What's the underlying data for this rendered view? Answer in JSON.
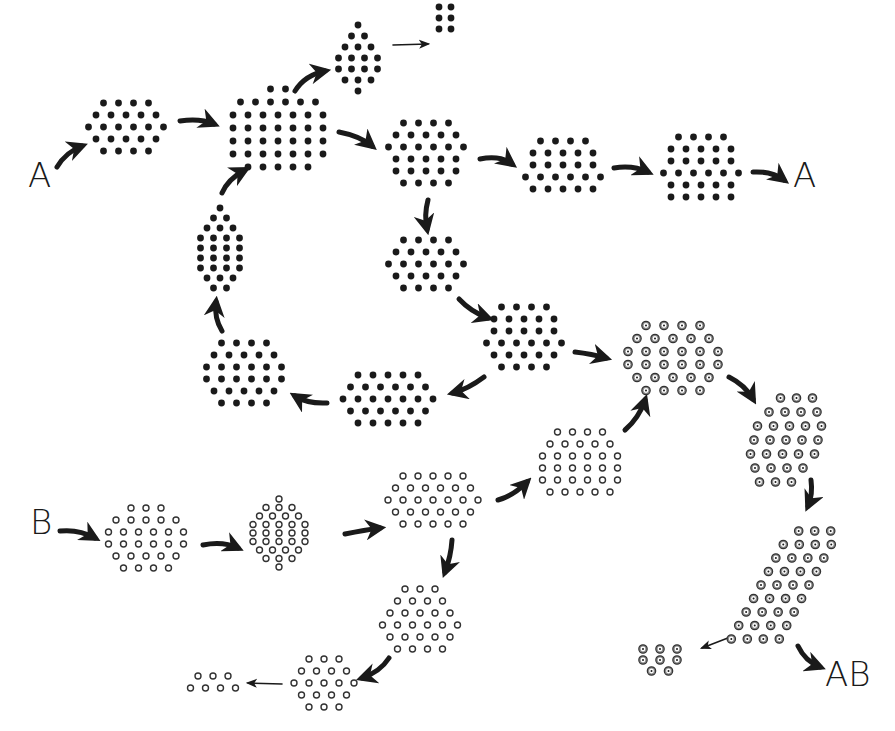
{
  "colors": {
    "background": "#ffffff",
    "solid_dot": "#1a1a1a",
    "ring_dot": "#333333",
    "target_dot_fill": "#8a8a8a",
    "arrow": "#1a1a1a"
  },
  "labels": [
    {
      "id": "A-start",
      "text": "A",
      "x": 28,
      "y": 158
    },
    {
      "id": "A-end",
      "text": "A",
      "x": 793,
      "y": 158
    },
    {
      "id": "B-start",
      "text": "B",
      "x": 30,
      "y": 505
    },
    {
      "id": "AB-end",
      "text": "AB",
      "x": 825,
      "y": 657
    }
  ],
  "clusters": [
    {
      "id": "a1",
      "type": "solid",
      "cx": 126,
      "cy": 127,
      "rows": [
        4,
        5,
        6,
        5,
        4
      ],
      "dx": 15,
      "dy": 12,
      "shear": 0
    },
    {
      "id": "a2",
      "type": "solid",
      "cx": 278,
      "cy": 128,
      "rows": [
        2,
        6,
        7,
        7,
        7,
        7,
        5
      ],
      "dx": 15,
      "dy": 13,
      "shear": 0
    },
    {
      "id": "a3",
      "type": "solid",
      "cx": 358,
      "cy": 58,
      "rows": [
        1,
        2,
        3,
        4,
        4,
        3,
        1
      ],
      "dx": 13,
      "dy": 11,
      "shear": 0
    },
    {
      "id": "a3b",
      "type": "solid",
      "cx": 445,
      "cy": 18,
      "rows": [
        2,
        2,
        2
      ],
      "dx": 12,
      "dy": 11,
      "shear": 0
    },
    {
      "id": "a4",
      "type": "solid",
      "cx": 426,
      "cy": 153,
      "rows": [
        4,
        5,
        6,
        5,
        5,
        4
      ],
      "dx": 15,
      "dy": 12,
      "shear": 0
    },
    {
      "id": "a5",
      "type": "solid",
      "cx": 563,
      "cy": 165,
      "rows": [
        4,
        5,
        5,
        6,
        5
      ],
      "dx": 15,
      "dy": 12,
      "shear": 0
    },
    {
      "id": "a6",
      "type": "solid",
      "cx": 701,
      "cy": 167,
      "rows": [
        4,
        5,
        5,
        6,
        5,
        5
      ],
      "dx": 15,
      "dy": 12,
      "shear": 0
    },
    {
      "id": "a7",
      "type": "solid",
      "cx": 426,
      "cy": 264,
      "rows": [
        4,
        5,
        6,
        5,
        4
      ],
      "dx": 15,
      "dy": 12,
      "shear": 0
    },
    {
      "id": "a8",
      "type": "solid",
      "cx": 524,
      "cy": 337,
      "rows": [
        4,
        5,
        5,
        6,
        5,
        4
      ],
      "dx": 15,
      "dy": 12,
      "shear": 0
    },
    {
      "id": "a9",
      "type": "solid",
      "cx": 388,
      "cy": 399,
      "rows": [
        5,
        6,
        7,
        6,
        5
      ],
      "dx": 15,
      "dy": 12,
      "shear": 0
    },
    {
      "id": "a10",
      "type": "solid",
      "cx": 244,
      "cy": 373,
      "rows": [
        4,
        5,
        6,
        6,
        5,
        4
      ],
      "dx": 15,
      "dy": 12,
      "shear": 0
    },
    {
      "id": "a11",
      "type": "solid",
      "cx": 220,
      "cy": 248,
      "rows": [
        1,
        2,
        3,
        4,
        4,
        4,
        4,
        3,
        2
      ],
      "dx": 13,
      "dy": 10,
      "shear": 0
    },
    {
      "id": "b1",
      "type": "ring",
      "cx": 146,
      "cy": 538,
      "rows": [
        3,
        5,
        6,
        6,
        5,
        4
      ],
      "dx": 15,
      "dy": 12,
      "shear": 0
    },
    {
      "id": "b2",
      "type": "ring",
      "cx": 279,
      "cy": 533,
      "rows": [
        1,
        3,
        4,
        5,
        5,
        5,
        4,
        3,
        1
      ],
      "dx": 13,
      "dy": 8.5,
      "shear": 0
    },
    {
      "id": "b3",
      "type": "ring",
      "cx": 433,
      "cy": 500,
      "rows": [
        5,
        6,
        7,
        6,
        5
      ],
      "dx": 15,
      "dy": 12,
      "shear": 0
    },
    {
      "id": "b4",
      "type": "ring",
      "cx": 580,
      "cy": 462,
      "rows": [
        4,
        5,
        6,
        6,
        6,
        5
      ],
      "dx": 15,
      "dy": 12,
      "shear": 0
    },
    {
      "id": "b5",
      "type": "ring",
      "cx": 420,
      "cy": 619,
      "rows": [
        3,
        4,
        5,
        6,
        5,
        4
      ],
      "dx": 15,
      "dy": 12,
      "shear": 0
    },
    {
      "id": "b6",
      "type": "ring",
      "cx": 324,
      "cy": 683,
      "rows": [
        3,
        4,
        5,
        4,
        3
      ],
      "dx": 15,
      "dy": 12,
      "shear": 0
    },
    {
      "id": "b7",
      "type": "ring",
      "cx": 213,
      "cy": 682,
      "rows": [
        3,
        4
      ],
      "dx": 15,
      "dy": 12,
      "shear": 0
    },
    {
      "id": "ab1",
      "type": "target",
      "cx": 673,
      "cy": 358,
      "rows": [
        4,
        5,
        6,
        6,
        5,
        4
      ],
      "dx": 18,
      "dy": 13,
      "shear": 0
    },
    {
      "id": "ab2",
      "type": "target",
      "cx": 786,
      "cy": 440,
      "rows": [
        3,
        4,
        5,
        5,
        5,
        4,
        3
      ],
      "dx": 16,
      "dy": 14,
      "shear": -0.25
    },
    {
      "id": "ab3",
      "type": "target",
      "cx": 785,
      "cy": 585,
      "rows": [
        3,
        4,
        4,
        4,
        4,
        4,
        4,
        4,
        4
      ],
      "dx": 16,
      "dy": 13.5,
      "shear": -0.55
    },
    {
      "id": "ab4",
      "type": "target",
      "cx": 660,
      "cy": 660,
      "rows": [
        3,
        3,
        2
      ],
      "dx": 17,
      "dy": 11,
      "shear": 0
    }
  ],
  "arrows": [
    {
      "id": "arr-A-a1",
      "d": "M57,167 Q66,152 82,146",
      "weight": "heavy"
    },
    {
      "id": "arr-a1-a2",
      "d": "M180,121 Q200,118 214,124",
      "weight": "heavy"
    },
    {
      "id": "arr-a2-a3",
      "d": "M295,91 Q305,75 325,71",
      "weight": "heavy"
    },
    {
      "id": "arr-a3-a3b",
      "d": "M393,45 L428,44",
      "weight": "thin"
    },
    {
      "id": "arr-a2-a4",
      "d": "M339,132 Q360,136 372,146",
      "weight": "heavy"
    },
    {
      "id": "arr-a4-a5",
      "d": "M480,159 Q500,155 512,164",
      "weight": "heavy"
    },
    {
      "id": "arr-a5-a6",
      "d": "M614,168 Q633,165 648,172",
      "weight": "heavy"
    },
    {
      "id": "arr-a6-A",
      "d": "M753,172 Q772,171 784,180",
      "weight": "heavy"
    },
    {
      "id": "arr-a4-a7",
      "d": "M428,200 Q424,215 427,229",
      "weight": "heavy"
    },
    {
      "id": "arr-a7-a8",
      "d": "M459,299 Q471,312 488,318",
      "weight": "heavy"
    },
    {
      "id": "arr-a8-a9",
      "d": "M484,377 Q468,389 453,393",
      "weight": "heavy"
    },
    {
      "id": "arr-a9-a10",
      "d": "M327,403 Q308,404 295,396",
      "weight": "heavy"
    },
    {
      "id": "arr-a10-a11",
      "d": "M222,331 Q214,318 216,302",
      "weight": "heavy"
    },
    {
      "id": "arr-a11-a2",
      "d": "M222,193 Q228,179 245,170",
      "weight": "heavy"
    },
    {
      "id": "arr-a8-ab1",
      "d": "M575,352 Q592,354 606,358",
      "weight": "heavy"
    },
    {
      "id": "arr-b4-ab1",
      "d": "M625,430 Q639,418 645,400",
      "weight": "heavy"
    },
    {
      "id": "arr-ab1-ab2",
      "d": "M729,377 Q745,385 753,399",
      "weight": "heavy"
    },
    {
      "id": "arr-ab2-ab3",
      "d": "M811,480 Q813,495 808,506",
      "weight": "heavy"
    },
    {
      "id": "arr-ab3-ab4",
      "d": "M733,636 L702,648",
      "weight": "thin"
    },
    {
      "id": "arr-ab3-AB",
      "d": "M798,646 Q805,661 820,667",
      "weight": "heavy"
    },
    {
      "id": "arr-B-b1",
      "d": "M60,531 Q79,529 95,538",
      "weight": "heavy"
    },
    {
      "id": "arr-b1-b2",
      "d": "M203,545 Q223,541 238,548",
      "weight": "heavy"
    },
    {
      "id": "arr-b2-b3",
      "d": "M345,534 Q365,530 380,528",
      "weight": "heavy"
    },
    {
      "id": "arr-b3-b4",
      "d": "M498,500 Q513,496 527,482",
      "weight": "heavy"
    },
    {
      "id": "arr-b3-b5",
      "d": "M452,540 Q451,556 445,572",
      "weight": "heavy"
    },
    {
      "id": "arr-b5-b6",
      "d": "M389,658 Q380,672 362,678",
      "weight": "heavy"
    },
    {
      "id": "arr-b6-b7",
      "d": "M282,684 L248,683",
      "weight": "thin"
    }
  ]
}
